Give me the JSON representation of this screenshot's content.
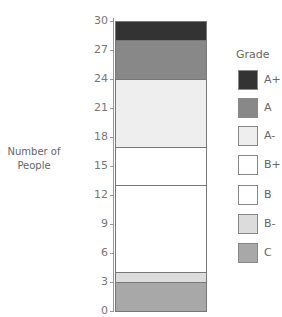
{
  "chart_data": {
    "type": "bar",
    "stacked": true,
    "title": "",
    "xlabel": "",
    "ylabel": "Number of People",
    "ylabel_lines": [
      "Number of",
      "People"
    ],
    "ylim": [
      0,
      30
    ],
    "yticks": [
      0,
      3,
      6,
      9,
      12,
      15,
      18,
      21,
      24,
      27,
      30
    ],
    "grid": false,
    "legend_position": "right",
    "legend_title": "Grade",
    "categories": [
      ""
    ],
    "series": [
      {
        "name": "C",
        "values": [
          3
        ],
        "color": "#a8a8a8"
      },
      {
        "name": "B-",
        "values": [
          1
        ],
        "color": "#dcdcdc"
      },
      {
        "name": "B",
        "values": [
          9
        ],
        "color": "#ffffff"
      },
      {
        "name": "B+",
        "values": [
          4
        ],
        "color": "#ffffff"
      },
      {
        "name": "A-",
        "values": [
          7
        ],
        "color": "#eeeeee"
      },
      {
        "name": "A",
        "values": [
          4
        ],
        "color": "#888888"
      },
      {
        "name": "A+",
        "values": [
          2
        ],
        "color": "#333333"
      }
    ]
  },
  "legend": {
    "title": "Grade",
    "items": [
      {
        "label": "A+",
        "color": "#333333"
      },
      {
        "label": "A",
        "color": "#888888"
      },
      {
        "label": "A-",
        "color": "#eeeeee"
      },
      {
        "label": "B+",
        "color": "#ffffff"
      },
      {
        "label": "B",
        "color": "#ffffff"
      },
      {
        "label": "B-",
        "color": "#dcdcdc"
      },
      {
        "label": "C",
        "color": "#a8a8a8"
      }
    ]
  }
}
